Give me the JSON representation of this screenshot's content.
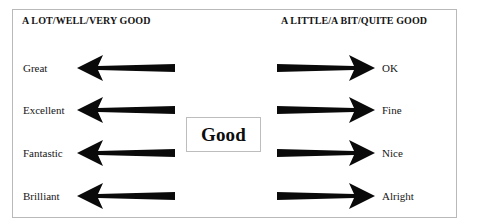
{
  "diagram": {
    "type": "concept-map",
    "center": {
      "label": "Good"
    },
    "columns": {
      "left": {
        "header": "A LOT/WELL/VERY GOOD",
        "arrow_direction": "left",
        "arrow_icon": "arrow-left-icon"
      },
      "right": {
        "header": "A LITTLE/A BIT/QUITE GOOD",
        "arrow_direction": "right",
        "arrow_icon": "arrow-right-icon"
      }
    },
    "rows": [
      {
        "left_label": "Great",
        "right_label": "OK"
      },
      {
        "left_label": "Excellent",
        "right_label": "Fine"
      },
      {
        "left_label": "Fantastic",
        "right_label": "Nice"
      },
      {
        "left_label": "Brilliant",
        "right_label": "Alright"
      }
    ],
    "colors": {
      "background": "#ffffff",
      "frame_border": "#b9b9b9",
      "arrow_fill": "#0a0a0a",
      "text": "#141414"
    }
  }
}
